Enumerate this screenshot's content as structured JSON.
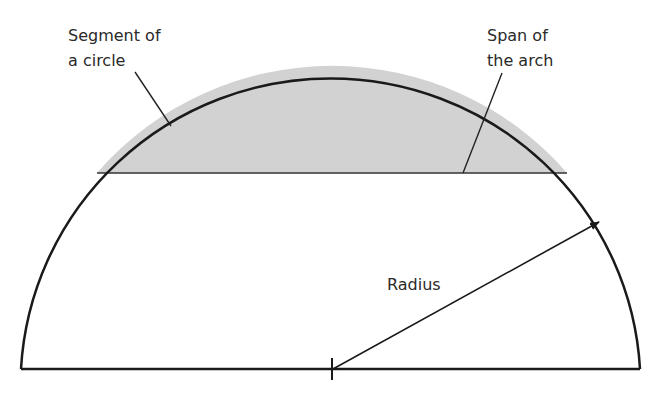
{
  "diagram": {
    "colors": {
      "segment_fill": "#d2d2d2",
      "stroke": "#1a1a1a",
      "background": "#ffffff"
    },
    "labels": {
      "segment_line1": "Segment of",
      "segment_line2": "a circle",
      "span_line1": "Span of",
      "span_line2": "the arch",
      "radius": "Radius"
    }
  }
}
